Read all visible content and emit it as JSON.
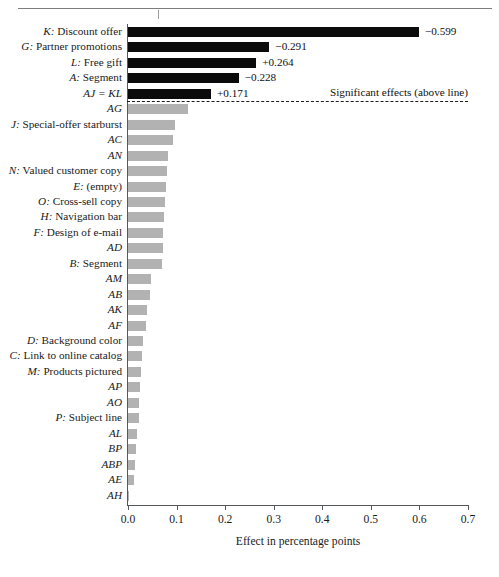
{
  "chart_data": {
    "type": "bar",
    "orientation": "horizontal",
    "title": "",
    "xlabel": "Effect in percentage points",
    "ylabel": "",
    "xlim": [
      0.0,
      0.7
    ],
    "xticks": [
      "0.0",
      "0.1",
      "0.2",
      "0.3",
      "0.4",
      "0.5",
      "0.6",
      "0.7"
    ],
    "xtick_values": [
      0.0,
      0.1,
      0.2,
      0.3,
      0.4,
      0.5,
      0.6,
      0.7
    ],
    "grid": false,
    "legend": null,
    "annotation": "Significant effects (above line)",
    "significance_threshold_index": 5,
    "colors": {
      "significant": "#0b0b0b",
      "not_significant": "#b2b2b2",
      "axis": "#55595c",
      "text": "#1a1a1a"
    },
    "categories": [
      "K: Discount offer",
      "G: Partner promotions",
      "L: Free gift",
      "A: Segment",
      "AJ = KL",
      "AG",
      "J: Special-offer starburst",
      "AC",
      "AN",
      "N: Valued customer copy",
      "E: (empty)",
      "O: Cross-sell copy",
      "H: Navigation bar",
      "F: Design of e-mail",
      "AD",
      "B: Segment",
      "AM",
      "AB",
      "AK",
      "AF",
      "D: Background color",
      "C: Link to online catalog",
      "M: Products pictured",
      "AP",
      "AO",
      "P: Subject line",
      "AL",
      "BP",
      "ABP",
      "AE",
      "AH"
    ],
    "values": [
      0.599,
      0.291,
      0.264,
      0.228,
      0.171,
      0.124,
      0.097,
      0.093,
      0.082,
      0.08,
      0.078,
      0.077,
      0.075,
      0.073,
      0.072,
      0.07,
      0.048,
      0.046,
      0.039,
      0.037,
      0.03,
      0.029,
      0.026,
      0.024,
      0.023,
      0.022,
      0.018,
      0.016,
      0.014,
      0.013,
      0.003
    ],
    "value_labels": [
      "−0.599",
      "−0.291",
      "+0.264",
      "−0.228",
      "+0.171",
      "",
      "",
      "",
      "",
      "",
      "",
      "",
      "",
      "",
      "",
      "",
      "",
      "",
      "",
      "",
      "",
      "",
      "",
      "",
      "",
      "",
      "",
      "",
      "",
      "",
      ""
    ],
    "significant": [
      true,
      true,
      true,
      true,
      true,
      false,
      false,
      false,
      false,
      false,
      false,
      false,
      false,
      false,
      false,
      false,
      false,
      false,
      false,
      false,
      false,
      false,
      false,
      false,
      false,
      false,
      false,
      false,
      false,
      false,
      false
    ]
  }
}
